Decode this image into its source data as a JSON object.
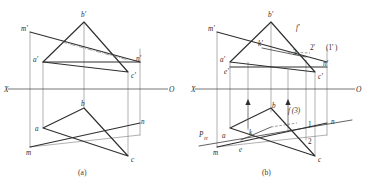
{
  "figure": {
    "title_a": "(a)",
    "title_b": "(b)",
    "axis_left_label": "X",
    "axis_right_label": "O"
  },
  "fig_a": {
    "caption": "(a)",
    "axis": {
      "x_label": "X",
      "o_label": "O"
    },
    "labels": {
      "m_prime": "m'",
      "b_prime": "b'",
      "a_prime": "a'",
      "n_prime": "n'",
      "c_prime": "c'",
      "b": "b",
      "a": "a",
      "m": "m",
      "n": "n",
      "c": "c"
    }
  },
  "fig_b": {
    "caption": "(b)",
    "axis": {
      "x_label": "X",
      "o_label": "O"
    },
    "labels": {
      "m_prime": "m'",
      "b_prime": "b'",
      "f_prime": "f'",
      "k_prime": "k'",
      "three_prime": "3",
      "two_prime": "2'",
      "one_prime_paren": "(1' )",
      "a_prime": "a'",
      "e_prime": "e'",
      "n_prime": "n'",
      "c_prime": "c'",
      "p_h": "P",
      "p_h_sub": "H",
      "m": "m",
      "e": "e",
      "a": "a",
      "k": "k",
      "b": "b",
      "f_three": "f (3)",
      "one": "1",
      "two": "2",
      "n": "n",
      "c": "c"
    }
  },
  "colors": {
    "ink": "#2f2f2f",
    "thin": "#6e6e6e",
    "axis": "#4a4a4a",
    "background": "#ffffff"
  }
}
